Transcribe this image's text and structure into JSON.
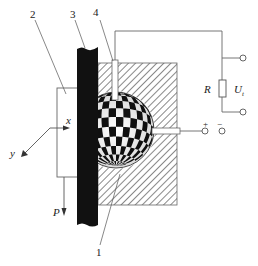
{
  "diagram": {
    "type": "tactile/slip sensor schematic",
    "colors": {
      "line": "#555555",
      "black_bar": "#111111",
      "hatch": "#666666",
      "background": "#ffffff"
    },
    "callouts": [
      {
        "id": "1",
        "label": "1",
        "target": "checkered-ball"
      },
      {
        "id": "2",
        "label": "2",
        "target": "object-plate"
      },
      {
        "id": "3",
        "label": "3",
        "target": "black-bar"
      },
      {
        "id": "4",
        "label": "4",
        "target": "top-contact-probe"
      }
    ],
    "axes": {
      "x_label": "x",
      "y_label": "y",
      "force_label": "P"
    },
    "circuit": {
      "resistor_label": "R",
      "voltage_label": "U",
      "voltage_subscript": "t",
      "plus_sign": "+",
      "minus_sign": "−"
    }
  }
}
